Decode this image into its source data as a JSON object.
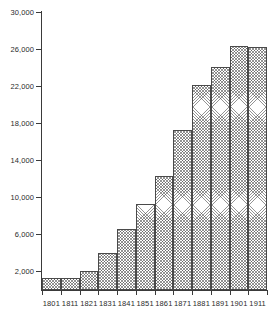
{
  "chart_data": {
    "type": "bar",
    "title": "",
    "subtitle": "",
    "xlabel": "",
    "ylabel": "",
    "categories": [
      "1801",
      "1811",
      "1821",
      "1831",
      "1841",
      "1851",
      "1861",
      "1871",
      "1881",
      "1891",
      "1901",
      "1911"
    ],
    "values": [
      1250,
      1350,
      2100,
      3950,
      6600,
      9300,
      12250,
      17300,
      22150,
      24050,
      26300,
      26250
    ],
    "ylim": [
      0,
      30000
    ],
    "xlim_categories": 12,
    "y_ticks": [
      2000,
      6000,
      10000,
      14000,
      18000,
      22000,
      26000,
      30000
    ],
    "y_tick_labels": [
      "2,000",
      "6,000",
      "10,000",
      "14,000",
      "18,000",
      "22,000",
      "26,000",
      "30,000"
    ],
    "grid": false,
    "legend": null,
    "legend_position": "none",
    "series_name": "Population",
    "bar_style": {
      "fill": "cross-hatch",
      "fill_color": "#ffffff",
      "hatch_color": "#3c3c3c",
      "border_color": "#4a4a4a"
    },
    "axis_color": "#3a3a3a",
    "background": "#ffffff",
    "text_color": "#2b2b2b"
  }
}
